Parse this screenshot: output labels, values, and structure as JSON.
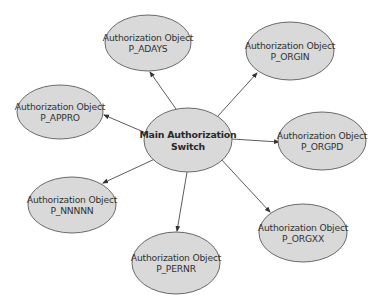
{
  "colors": {
    "node_fill": "#d9d9d9",
    "node_stroke": "#5a5a5a",
    "edge": "#4a4a4a",
    "text": "#333333"
  },
  "center": {
    "line1": "Main Authorization",
    "line2": "Switch",
    "cx": 188,
    "cy": 140,
    "rx": 44,
    "ry": 32
  },
  "nodes": [
    {
      "id": "p_adays",
      "line1": "Authorization Object",
      "line2": "P_ADAYS",
      "cx": 148,
      "cy": 43,
      "rx": 43,
      "ry": 28
    },
    {
      "id": "p_orgin",
      "line1": "Authorization Object",
      "line2": "P_ORGIN",
      "cx": 290,
      "cy": 51,
      "rx": 44,
      "ry": 29
    },
    {
      "id": "p_appro",
      "line1": "Authorization Object",
      "line2": "P_APPRO",
      "cx": 60,
      "cy": 112,
      "rx": 43,
      "ry": 27
    },
    {
      "id": "p_orgpd",
      "line1": "Authorization Object",
      "line2": "P_ORGPD",
      "cx": 322,
      "cy": 141,
      "rx": 44,
      "ry": 29
    },
    {
      "id": "p_nnnnn",
      "line1": "Authorization Object",
      "line2": "P_NNNNN",
      "cx": 72,
      "cy": 205,
      "rx": 44,
      "ry": 28
    },
    {
      "id": "p_orgxx",
      "line1": "Authorization Object",
      "line2": "P_ORGXX",
      "cx": 303,
      "cy": 233,
      "rx": 44,
      "ry": 29
    },
    {
      "id": "p_pernr",
      "line1": "Authorization Object",
      "line2": "P_PERNR",
      "cx": 176,
      "cy": 263,
      "rx": 44,
      "ry": 31
    }
  ],
  "edges": [
    {
      "to": "p_adays",
      "x1": 176,
      "y1": 109,
      "x2": 150,
      "y2": 72
    },
    {
      "to": "p_orgin",
      "x1": 218,
      "y1": 116,
      "x2": 257,
      "y2": 73
    },
    {
      "to": "p_appro",
      "x1": 146,
      "y1": 133,
      "x2": 104,
      "y2": 115
    },
    {
      "to": "p_orgpd",
      "x1": 232,
      "y1": 139,
      "x2": 279,
      "y2": 142
    },
    {
      "to": "p_nnnnn",
      "x1": 157,
      "y1": 158,
      "x2": 103,
      "y2": 183
    },
    {
      "to": "p_orgxx",
      "x1": 220,
      "y1": 158,
      "x2": 270,
      "y2": 212
    },
    {
      "to": "p_pernr",
      "x1": 187,
      "y1": 172,
      "x2": 177,
      "y2": 231
    }
  ]
}
